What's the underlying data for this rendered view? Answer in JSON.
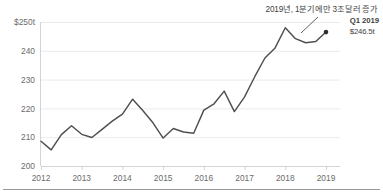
{
  "chart_data": {
    "type": "line",
    "title": "",
    "annotation": "2019년, 1분기에만 3조달러 증가",
    "callout_label": "Q1 2019",
    "callout_value": "$246.5t",
    "xlabel": "",
    "ylabel": "",
    "ylim": [
      200,
      250
    ],
    "yticks": [
      200,
      210,
      220,
      230,
      240,
      250
    ],
    "ytick_labels": [
      "200",
      "210",
      "220",
      "230",
      "240",
      "$250t"
    ],
    "xticks": [
      2012,
      2013,
      2014,
      2015,
      2016,
      2017,
      2018,
      2019
    ],
    "xtick_labels": [
      "2012",
      "2013",
      "2014",
      "2015",
      "2016",
      "2017",
      "2018",
      "2019"
    ],
    "grid": true,
    "legend": "none",
    "line_color": "#4f4f4f",
    "grid_color": "#e6e6e6",
    "axis_color": "#c9c9c9",
    "text_color": "#6b6b6b",
    "series": [
      {
        "name": "Global debt",
        "x": [
          2012.0,
          2012.25,
          2012.5,
          2012.75,
          2013.0,
          2013.25,
          2013.5,
          2013.75,
          2014.0,
          2014.25,
          2014.5,
          2014.75,
          2015.0,
          2015.25,
          2015.5,
          2015.75,
          2016.0,
          2016.25,
          2016.5,
          2016.75,
          2017.0,
          2017.25,
          2017.5,
          2017.75,
          2018.0,
          2018.25,
          2018.5,
          2018.75,
          2019.0
        ],
        "values": [
          208.6,
          205.6,
          210.9,
          214.0,
          211.0,
          209.9,
          212.7,
          215.6,
          218.0,
          223.2,
          219.3,
          215.0,
          209.7,
          213.0,
          211.8,
          211.4,
          219.4,
          221.6,
          226.0,
          218.9,
          224.0,
          231.0,
          237.5,
          241.0,
          248.0,
          244.2,
          242.8,
          243.2,
          246.5
        ]
      }
    ]
  }
}
